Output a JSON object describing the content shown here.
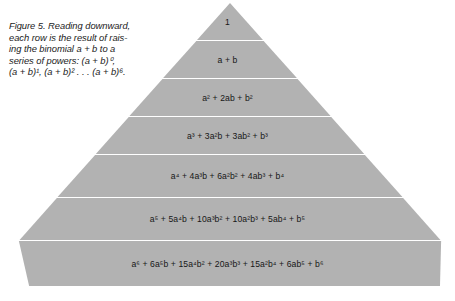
{
  "figure": {
    "caption_lines": [
      "Figure 5. Reading downward,",
      "each row is the result of rais-",
      "ing the binomial a + b to a",
      "series of powers: (a + b)⁰,",
      "(a + b)¹, (a + b)² . . . (a + b)⁶."
    ],
    "caption_full": "Figure 5. Reading downward, each row is the result of raising the binomial a + b to a series of powers: (a + b)⁰, (a + b)¹, (a + b)² . . . (a + b)⁶.",
    "caption_label": "Figure 5."
  },
  "pyramid": {
    "fill_color": "#b2b2b2",
    "divider_color": "#ffffff",
    "text_color": "#171717",
    "rows": [
      {
        "power": 0,
        "expression": "1"
      },
      {
        "power": 1,
        "expression": "a + b"
      },
      {
        "power": 2,
        "expression": "a² + 2ab + b²"
      },
      {
        "power": 3,
        "expression": "a³ + 3a²b + 3ab² + b³"
      },
      {
        "power": 4,
        "expression": "a⁴ + 4a³b + 6a²b² + 4ab³ + b⁴"
      },
      {
        "power": 5,
        "expression": "a⁵ + 5a⁴b + 10a³b² + 10a²b³ + 5ab⁴ + b⁵"
      },
      {
        "power": 6,
        "expression": "a⁶ + 6a⁵b + 15a⁴b² + 20a³b³ + 15a²b⁴ + 6ab⁵ + b⁶"
      }
    ],
    "coefficients": [
      [
        1
      ],
      [
        1,
        1
      ],
      [
        1,
        2,
        1
      ],
      [
        1,
        3,
        3,
        1
      ],
      [
        1,
        4,
        6,
        4,
        1
      ],
      [
        1,
        5,
        10,
        10,
        5,
        1
      ],
      [
        1,
        6,
        15,
        20,
        15,
        6,
        1
      ]
    ]
  }
}
